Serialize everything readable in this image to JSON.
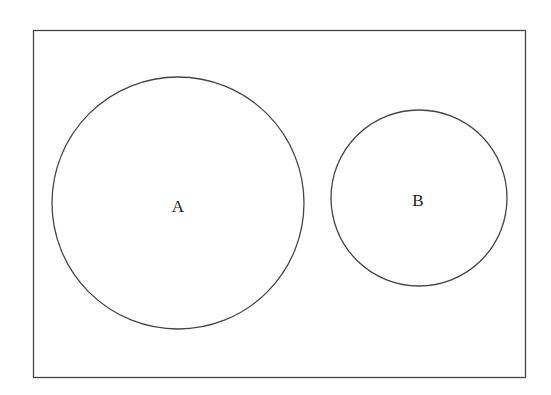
{
  "diagram": {
    "type": "venn",
    "universe": {
      "x": 33,
      "y": 30,
      "width": 492,
      "height": 347,
      "stroke": "#444444"
    },
    "sets": [
      {
        "label": "A",
        "cx": 178,
        "cy": 203,
        "r": 126,
        "label_x": 178,
        "label_y": 212
      },
      {
        "label": "B",
        "cx": 419,
        "cy": 198,
        "r": 88,
        "label_x": 418,
        "label_y": 206
      }
    ],
    "stroke_color": "#444444",
    "background": "#ffffff"
  }
}
